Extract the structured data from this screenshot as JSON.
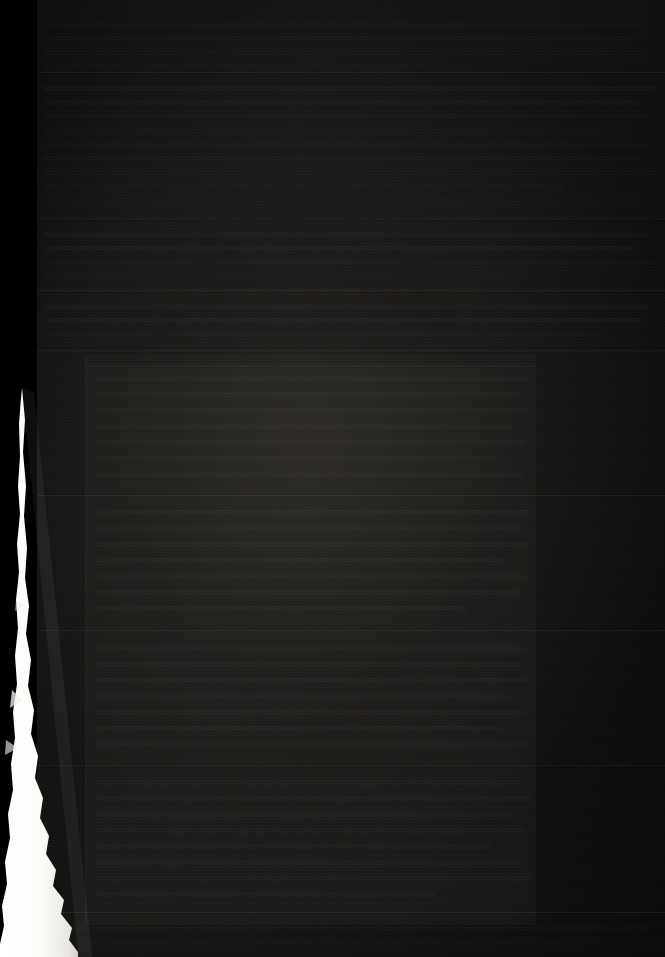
{
  "document": {
    "kind": "scanned-page",
    "description": "Severely underexposed photographic scan of a printed document page",
    "legibility": "illegible",
    "visible_text": "",
    "page_width_px": 665,
    "page_height_px": 957
  },
  "colors": {
    "background_black": "#000000",
    "paper_dark": "#121110",
    "paper_dark_highlight": "#1a1815",
    "rule_line": "#aaa096",
    "torn_edge_white": "#fbfbf8",
    "text_ghost": "#c4baac"
  },
  "regions": {
    "left_void": {
      "label": "black margin outside sheet",
      "x": 0,
      "y": 0,
      "width": 37,
      "height": 957
    },
    "page_surface": {
      "label": "document sheet",
      "x": 35,
      "y": 0,
      "width": 630,
      "height": 957
    },
    "content_block": {
      "label": "lighter central text block",
      "x": 85,
      "y": 355,
      "width": 450,
      "height": 570
    },
    "torn_edge": {
      "label": "bright curled page edge",
      "x": 0,
      "y": 390,
      "width": 80,
      "height": 567
    }
  },
  "rules": [
    {
      "name": "rule-1",
      "y": 72,
      "x": 37,
      "width": 628,
      "strength": "soft"
    },
    {
      "name": "rule-2",
      "y": 218,
      "x": 37,
      "width": 628,
      "strength": "soft"
    },
    {
      "name": "rule-3",
      "y": 290,
      "x": 37,
      "width": 628,
      "strength": "normal"
    },
    {
      "name": "rule-4",
      "y": 350,
      "x": 37,
      "width": 628,
      "strength": "normal"
    },
    {
      "name": "rule-5",
      "y": 495,
      "x": 37,
      "width": 628,
      "strength": "normal"
    },
    {
      "name": "rule-6",
      "y": 630,
      "x": 37,
      "width": 628,
      "strength": "normal"
    },
    {
      "name": "rule-7",
      "y": 765,
      "x": 37,
      "width": 628,
      "strength": "soft"
    },
    {
      "name": "rule-8",
      "y": 912,
      "x": 37,
      "width": 628,
      "strength": "normal"
    }
  ],
  "column_edges": [
    {
      "name": "column-edge-left",
      "x": 85,
      "y": 355,
      "height": 570
    },
    {
      "name": "column-edge-right",
      "x": 535,
      "y": 355,
      "height": 570
    }
  ],
  "text_rows": [
    {
      "y": 22,
      "x": 44,
      "w": 600,
      "o": "faint"
    },
    {
      "y": 36,
      "x": 44,
      "w": 588,
      "o": "faint"
    },
    {
      "y": 50,
      "x": 44,
      "w": 604,
      "o": "faint"
    },
    {
      "y": 64,
      "x": 44,
      "w": 430,
      "o": "faint"
    },
    {
      "y": 86,
      "x": 44,
      "w": 610,
      "o": "dim"
    },
    {
      "y": 100,
      "x": 44,
      "w": 596,
      "o": "dim"
    },
    {
      "y": 114,
      "x": 44,
      "w": 608,
      "o": "faint"
    },
    {
      "y": 128,
      "x": 44,
      "w": 572,
      "o": "faint"
    },
    {
      "y": 142,
      "x": 44,
      "w": 602,
      "o": "faint"
    },
    {
      "y": 156,
      "x": 44,
      "w": 594,
      "o": "faint"
    },
    {
      "y": 170,
      "x": 44,
      "w": 612,
      "o": "faint"
    },
    {
      "y": 184,
      "x": 44,
      "w": 520,
      "o": "faint"
    },
    {
      "y": 198,
      "x": 44,
      "w": 600,
      "o": "faint"
    },
    {
      "y": 232,
      "x": 44,
      "w": 606,
      "o": "dim"
    },
    {
      "y": 246,
      "x": 44,
      "w": 590,
      "o": "dim"
    },
    {
      "y": 260,
      "x": 44,
      "w": 614,
      "o": "faint"
    },
    {
      "y": 274,
      "x": 44,
      "w": 466,
      "o": "faint"
    },
    {
      "y": 304,
      "x": 44,
      "w": 604,
      "o": "dim"
    },
    {
      "y": 318,
      "x": 44,
      "w": 598,
      "o": "dim"
    },
    {
      "y": 332,
      "x": 44,
      "w": 560,
      "o": "faint"
    },
    {
      "y": 376,
      "x": 95,
      "w": 432,
      "o": "dim"
    },
    {
      "y": 392,
      "x": 95,
      "w": 426,
      "o": "dim"
    },
    {
      "y": 408,
      "x": 95,
      "w": 434,
      "o": "dim"
    },
    {
      "y": 424,
      "x": 95,
      "w": 418,
      "o": "dim"
    },
    {
      "y": 440,
      "x": 95,
      "w": 430,
      "o": "dim"
    },
    {
      "y": 456,
      "x": 95,
      "w": 400,
      "o": "dim"
    },
    {
      "y": 472,
      "x": 95,
      "w": 428,
      "o": "dim"
    },
    {
      "y": 510,
      "x": 95,
      "w": 434,
      "o": "dim"
    },
    {
      "y": 526,
      "x": 95,
      "w": 424,
      "o": "dim"
    },
    {
      "y": 542,
      "x": 95,
      "w": 432,
      "o": "dim"
    },
    {
      "y": 558,
      "x": 95,
      "w": 410,
      "o": "dim"
    },
    {
      "y": 574,
      "x": 95,
      "w": 430,
      "o": "dim"
    },
    {
      "y": 590,
      "x": 95,
      "w": 422,
      "o": "dim"
    },
    {
      "y": 606,
      "x": 95,
      "w": 372,
      "o": "dim"
    },
    {
      "y": 646,
      "x": 95,
      "w": 430,
      "o": "dim"
    },
    {
      "y": 662,
      "x": 95,
      "w": 428,
      "o": "dim"
    },
    {
      "y": 678,
      "x": 95,
      "w": 434,
      "o": "dim"
    },
    {
      "y": 694,
      "x": 95,
      "w": 414,
      "o": "dim"
    },
    {
      "y": 710,
      "x": 95,
      "w": 430,
      "o": "dim"
    },
    {
      "y": 726,
      "x": 95,
      "w": 406,
      "o": "dim"
    },
    {
      "y": 742,
      "x": 95,
      "w": 432,
      "o": "dim"
    },
    {
      "y": 780,
      "x": 95,
      "w": 428,
      "o": "dim"
    },
    {
      "y": 796,
      "x": 95,
      "w": 434,
      "o": "dim"
    },
    {
      "y": 812,
      "x": 95,
      "w": 418,
      "o": "dim"
    },
    {
      "y": 828,
      "x": 95,
      "w": 430,
      "o": "dim"
    },
    {
      "y": 844,
      "x": 95,
      "w": 396,
      "o": "dim"
    },
    {
      "y": 860,
      "x": 95,
      "w": 428,
      "o": "dim"
    },
    {
      "y": 876,
      "x": 95,
      "w": 434,
      "o": "dim"
    },
    {
      "y": 892,
      "x": 95,
      "w": 340,
      "o": "dim"
    },
    {
      "y": 926,
      "x": 44,
      "w": 604,
      "o": "faint"
    },
    {
      "y": 940,
      "x": 44,
      "w": 560,
      "o": "faint"
    }
  ]
}
